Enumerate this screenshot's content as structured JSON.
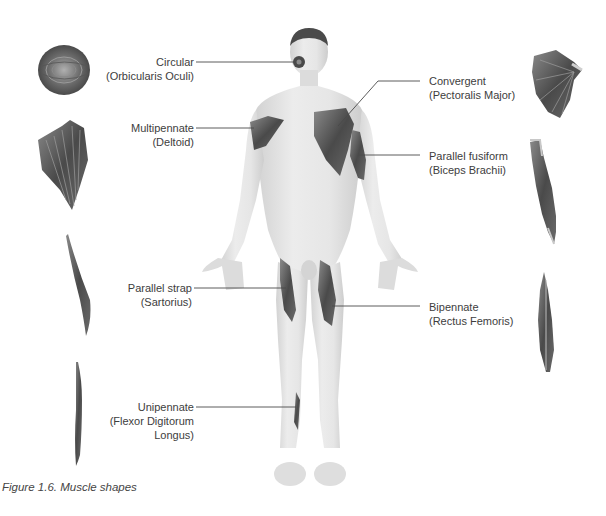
{
  "figure": {
    "caption": "Figure 1.6. Muscle shapes"
  },
  "labels": {
    "circular": {
      "type": "Circular",
      "example": "(Orbicularis Oculi)"
    },
    "multipennate": {
      "type": "Multipennate",
      "example": "(Deltoid)"
    },
    "parallel_strap": {
      "type": "Parallel strap",
      "example": "(Sartorius)"
    },
    "unipennate": {
      "type": "Unipennate",
      "example_line1": "(Flexor Digitorum",
      "example_line2": "Longus)"
    },
    "convergent": {
      "type": "Convergent",
      "example": "(Pectoralis Major)"
    },
    "parallel_fusiform": {
      "type": "Parallel fusiform",
      "example": "(Biceps Brachii)"
    },
    "bipennate": {
      "type": "Bipennate",
      "example": "(Rectus Femoris)"
    }
  },
  "colors": {
    "skin": "#e4e4e4",
    "skin_shadow": "#cfcfcf",
    "muscle": "#5e5e5e",
    "muscle_dark": "#3e3e3e",
    "hair": "#4a4a4a",
    "leader_line": "#4a4a4a",
    "text": "#3d3d3d"
  }
}
